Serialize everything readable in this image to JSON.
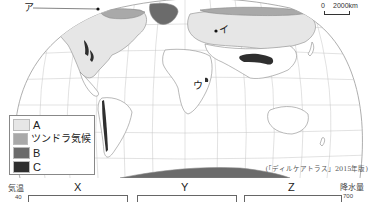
{
  "map": {
    "title": "World climate distribution map",
    "markers": [
      {
        "id": "a",
        "label": "ア"
      },
      {
        "id": "i",
        "label": "イ"
      },
      {
        "id": "u",
        "label": "ウ"
      }
    ],
    "scale": {
      "zero": "0",
      "distance": "2000km"
    },
    "source": "(「ディルケアトラス」2015年版)",
    "colors": {
      "land": "#ffffff",
      "ocean": "#ffffff",
      "grid": "#b8b8b8",
      "coast": "#8a8a8a",
      "A": "#e6e6e6",
      "tundra": "#a9a9a9",
      "B": "#6b6b6b",
      "C": "#2f2f2f"
    }
  },
  "legend": {
    "items": [
      {
        "key": "A",
        "label": "A"
      },
      {
        "key": "tundra",
        "label": "ツンドラ気候"
      },
      {
        "key": "B",
        "label": "B"
      },
      {
        "key": "C",
        "label": "C"
      }
    ]
  },
  "graphs": {
    "left_axis_label": "気温",
    "left_axis_top": "40",
    "right_axis_label": "降水量",
    "right_axis_top": "700",
    "titles": [
      "X",
      "Y",
      "Z"
    ]
  }
}
